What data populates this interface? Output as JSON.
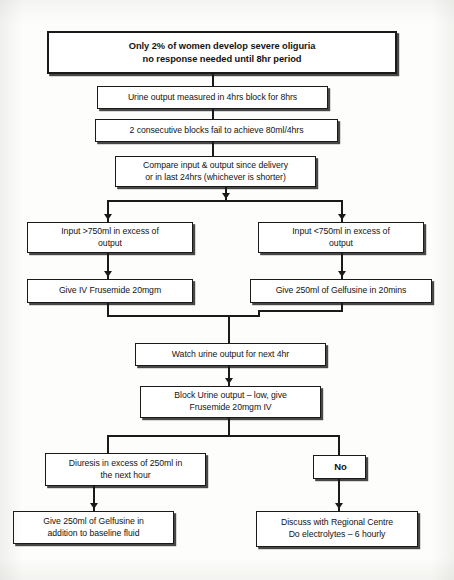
{
  "diagram": {
    "type": "flowchart",
    "colors": {
      "background": "#fdfdfb",
      "box_fill": "#ffffff",
      "line": "#1a1a1a",
      "text": "#131313"
    },
    "nodes": [
      {
        "id": "header",
        "label": "Only 2% of women develop severe oliguria\nno response needed until 8hr period",
        "line1": "Only 2% of women develop severe oliguria",
        "line2": "no response needed until 8hr period",
        "style": "bold",
        "x": 47,
        "y": 31,
        "w": 350,
        "h": 43
      },
      {
        "id": "measure",
        "label": "Urine output measured in 4hrs block for 8hrs",
        "line1": "Urine output measured in 4hrs block for 8hrs",
        "x": 97,
        "y": 86,
        "w": 231,
        "h": 23
      },
      {
        "id": "fail",
        "label": "2 consecutive blocks fail to achieve 80ml/4hrs",
        "line1": "2 consecutive blocks fail to achieve 80ml/4hrs",
        "x": 95,
        "y": 119,
        "w": 243,
        "h": 23
      },
      {
        "id": "compare",
        "label": "Compare input & output since delivery\nor in  last 24hrs (whichever is shorter)",
        "line1": "Compare input & output since delivery",
        "line2": "or in  last 24hrs (whichever is shorter)",
        "x": 115,
        "y": 156,
        "w": 201,
        "h": 31
      },
      {
        "id": "input-high",
        "label": "Input >750ml in excess of\noutput",
        "line1": "Input >750ml in excess of",
        "line2": "output",
        "x": 27,
        "y": 222,
        "w": 166,
        "h": 31
      },
      {
        "id": "input-low",
        "label": "Input <750ml in excess of\noutput",
        "line1": "Input <750ml in excess of",
        "line2": "output",
        "x": 258,
        "y": 222,
        "w": 166,
        "h": 31
      },
      {
        "id": "frusemide",
        "label": "Give IV Frusemide 20mgm",
        "line1": "Give IV Frusemide 20mgm",
        "x": 27,
        "y": 279,
        "w": 166,
        "h": 24
      },
      {
        "id": "gelfusine-20min",
        "label": "Give 250ml of Gelfusine in 20mins",
        "line1": "Give 250ml of Gelfusine in 20mins",
        "x": 250,
        "y": 279,
        "w": 182,
        "h": 24
      },
      {
        "id": "watch",
        "label": "Watch urine output for next 4hr",
        "line1": "Watch urine output for next 4hr",
        "x": 135,
        "y": 343,
        "w": 191,
        "h": 23
      },
      {
        "id": "block-low",
        "label": "Block Urine output – low, give\nFrusemide 20mgm IV",
        "line1": "Block Urine output – low, give",
        "line2": "Frusemide 20mgm IV",
        "x": 140,
        "y": 386,
        "w": 181,
        "h": 32
      },
      {
        "id": "diuresis",
        "label": "Diuresis in excess of 250ml in\nthe next hour",
        "line1": "Diuresis in excess of 250ml in",
        "line2": "the next hour",
        "x": 45,
        "y": 453,
        "w": 161,
        "h": 33
      },
      {
        "id": "no",
        "label": "No",
        "line1": "No",
        "style": "small-label",
        "x": 313,
        "y": 455,
        "w": 53,
        "h": 24
      },
      {
        "id": "gelfusine-baseline",
        "label": "Give 250ml of Gelfusine in\naddition to baseline fluid",
        "line1": "Give 250ml of Gelfusine in",
        "line2": "addition to baseline fluid",
        "x": 13,
        "y": 511,
        "w": 161,
        "h": 33
      },
      {
        "id": "discuss",
        "label": "Discuss with Regional Centre\nDo electrolytes – 6 hourly",
        "line1": "Discuss with Regional Centre",
        "line2": "Do electrolytes – 6 hourly",
        "x": 256,
        "y": 511,
        "w": 162,
        "h": 36
      }
    ],
    "edges": [
      {
        "from": "header",
        "to": "measure",
        "type": "straight"
      },
      {
        "from": "measure",
        "to": "fail",
        "type": "straight"
      },
      {
        "from": "fail",
        "to": "compare",
        "type": "straight"
      },
      {
        "from": "compare",
        "to": "input-high",
        "type": "split-left"
      },
      {
        "from": "compare",
        "to": "input-low",
        "type": "split-right"
      },
      {
        "from": "input-high",
        "to": "frusemide",
        "type": "straight"
      },
      {
        "from": "input-low",
        "to": "gelfusine-20min",
        "type": "straight"
      },
      {
        "from": "frusemide",
        "to": "watch",
        "type": "merge-left"
      },
      {
        "from": "gelfusine-20min",
        "to": "watch",
        "type": "merge-right"
      },
      {
        "from": "watch",
        "to": "block-low",
        "type": "straight"
      },
      {
        "from": "block-low",
        "to": "diuresis",
        "type": "split-left"
      },
      {
        "from": "block-low",
        "to": "no",
        "type": "split-right"
      },
      {
        "from": "diuresis",
        "to": "gelfusine-baseline",
        "type": "straight"
      },
      {
        "from": "no",
        "to": "discuss",
        "type": "straight"
      }
    ]
  }
}
